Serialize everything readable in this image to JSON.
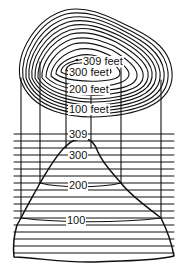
{
  "diagram": {
    "type": "topographic-contour-and-profile",
    "colors": {
      "ink": "#111111",
      "background": "#ffffff"
    },
    "contour_labels": [
      {
        "text": "309 feet",
        "x": 82,
        "y": 54
      },
      {
        "text": "300 feet",
        "x": 68,
        "y": 66
      },
      {
        "text": "200 feet",
        "x": 68,
        "y": 84
      },
      {
        "text": "100 feet",
        "x": 68,
        "y": 104
      }
    ],
    "profile_labels": [
      {
        "text": "309",
        "x": 68,
        "y": 128
      },
      {
        "text": "300",
        "x": 68,
        "y": 152
      },
      {
        "text": "200",
        "x": 68,
        "y": 181
      },
      {
        "text": "100",
        "x": 66,
        "y": 216
      }
    ]
  }
}
